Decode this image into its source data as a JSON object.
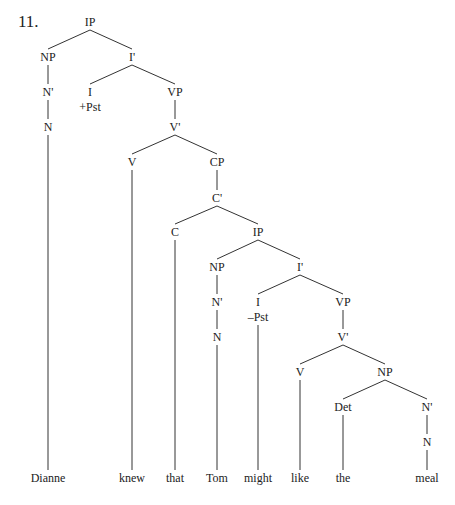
{
  "example_number": "11.",
  "colors": {
    "line": "#333333",
    "text": "#222222",
    "background": "#ffffff"
  },
  "nodes": [
    {
      "id": "ip1",
      "label": "IP",
      "x": 90,
      "y": 22
    },
    {
      "id": "np1",
      "label": "NP",
      "x": 48,
      "y": 57
    },
    {
      "id": "ibar1",
      "label": "I'",
      "x": 132,
      "y": 57
    },
    {
      "id": "nbar1",
      "label": "N'",
      "x": 48,
      "y": 92
    },
    {
      "id": "i1",
      "label": "I",
      "x": 90,
      "y": 92,
      "feature": "+Pst"
    },
    {
      "id": "vp1",
      "label": "VP",
      "x": 175,
      "y": 92
    },
    {
      "id": "n1",
      "label": "N",
      "x": 48,
      "y": 127
    },
    {
      "id": "vbar1",
      "label": "V'",
      "x": 175,
      "y": 127
    },
    {
      "id": "v1",
      "label": "V",
      "x": 132,
      "y": 162
    },
    {
      "id": "cp",
      "label": "CP",
      "x": 217,
      "y": 162
    },
    {
      "id": "cbar",
      "label": "C'",
      "x": 217,
      "y": 198
    },
    {
      "id": "c",
      "label": "C",
      "x": 175,
      "y": 232
    },
    {
      "id": "ip2",
      "label": "IP",
      "x": 258,
      "y": 232
    },
    {
      "id": "np2",
      "label": "NP",
      "x": 217,
      "y": 267
    },
    {
      "id": "ibar2",
      "label": "I'",
      "x": 300,
      "y": 267
    },
    {
      "id": "nbar2",
      "label": "N'",
      "x": 217,
      "y": 302
    },
    {
      "id": "i2",
      "label": "I",
      "x": 258,
      "y": 302,
      "feature": "–Pst"
    },
    {
      "id": "vp2",
      "label": "VP",
      "x": 343,
      "y": 302
    },
    {
      "id": "n2",
      "label": "N",
      "x": 217,
      "y": 337
    },
    {
      "id": "vbar2",
      "label": "V'",
      "x": 343,
      "y": 337
    },
    {
      "id": "v2",
      "label": "V",
      "x": 300,
      "y": 372
    },
    {
      "id": "np3",
      "label": "NP",
      "x": 385,
      "y": 372
    },
    {
      "id": "det",
      "label": "Det",
      "x": 343,
      "y": 407
    },
    {
      "id": "nbar3",
      "label": "N'",
      "x": 427,
      "y": 407
    },
    {
      "id": "n3",
      "label": "N",
      "x": 427,
      "y": 442
    }
  ],
  "words": [
    {
      "text": "Dianne",
      "x": 48,
      "y": 478,
      "parent": "n1"
    },
    {
      "text": "knew",
      "x": 132,
      "y": 478,
      "parent": "v1"
    },
    {
      "text": "that",
      "x": 175,
      "y": 478,
      "parent": "c"
    },
    {
      "text": "Tom",
      "x": 217,
      "y": 478,
      "parent": "n2"
    },
    {
      "text": "might",
      "x": 258,
      "y": 478,
      "parent": "i2"
    },
    {
      "text": "like",
      "x": 300,
      "y": 478,
      "parent": "v2"
    },
    {
      "text": "the",
      "x": 343,
      "y": 478,
      "parent": "det"
    },
    {
      "text": "meal",
      "x": 427,
      "y": 478,
      "parent": "n3"
    }
  ],
  "edges": [
    [
      "ip1",
      "np1"
    ],
    [
      "ip1",
      "ibar1"
    ],
    [
      "np1",
      "nbar1"
    ],
    [
      "nbar1",
      "n1"
    ],
    [
      "ibar1",
      "i1"
    ],
    [
      "ibar1",
      "vp1"
    ],
    [
      "vp1",
      "vbar1"
    ],
    [
      "vbar1",
      "v1"
    ],
    [
      "vbar1",
      "cp"
    ],
    [
      "cp",
      "cbar"
    ],
    [
      "cbar",
      "c"
    ],
    [
      "cbar",
      "ip2"
    ],
    [
      "ip2",
      "np2"
    ],
    [
      "ip2",
      "ibar2"
    ],
    [
      "np2",
      "nbar2"
    ],
    [
      "nbar2",
      "n2"
    ],
    [
      "ibar2",
      "i2"
    ],
    [
      "ibar2",
      "vp2"
    ],
    [
      "vp2",
      "vbar2"
    ],
    [
      "vbar2",
      "v2"
    ],
    [
      "vbar2",
      "np3"
    ],
    [
      "np3",
      "det"
    ],
    [
      "np3",
      "nbar3"
    ],
    [
      "nbar3",
      "n3"
    ]
  ]
}
